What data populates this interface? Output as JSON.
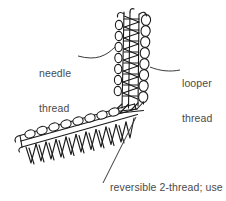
{
  "figure": {
    "type": "technical-illustration",
    "background_color": "#ffffff",
    "ink_color": "#1a1a1a",
    "text_color": "#4a4a4a"
  },
  "labels": {
    "needle": {
      "line1": "needle",
      "line2": "thread"
    },
    "looper": {
      "line1": "looper",
      "line2": "thread"
    },
    "caption": {
      "line1": "reversible 2-thread; use",
      "line2": "same thread throughout"
    }
  }
}
